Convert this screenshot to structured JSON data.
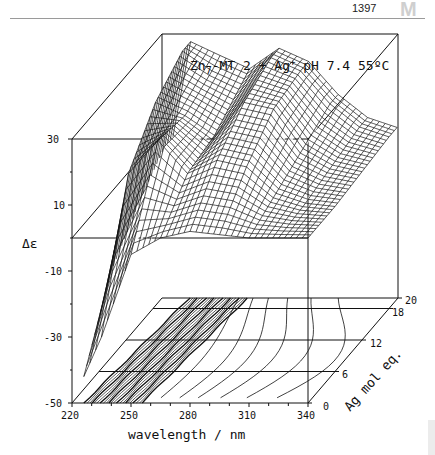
{
  "page": {
    "number": "1397",
    "section_mark": "M"
  },
  "chart_data": {
    "type": "surface3d",
    "title": "Zn7-MT 2 + Ag+  pH 7.4 55ºC",
    "title_parts": {
      "species": "Zn",
      "subscript": "7",
      "rest1": "-MT 2 + Ag",
      "superscript": "+",
      "rest2": "  pH 7.4 55ºC"
    },
    "xlabel": "wavelength / nm",
    "ylabel": "Δε",
    "zlabel": "Ag mol eq.",
    "x_ticks": [
      "220",
      "250",
      "280",
      "310",
      "340"
    ],
    "y_ticks": [
      "30",
      "10",
      "-10",
      "-30",
      "-50"
    ],
    "z_ticks": [
      "0",
      "6",
      "12",
      "18",
      "20"
    ],
    "xlim": [
      220,
      340
    ],
    "ylim": [
      -50,
      30
    ],
    "zlim": [
      0,
      20
    ],
    "grid": false,
    "legend": "none",
    "projection": "3D wireframe surface with contour map on floor plane",
    "surface_description": "CD titration of Zn7-MT 2 with Ag+: strong positive band near 230-240 nm saturating at ~30 at low Ag equivalents, broad positive ridge near 265-295 nm growing with Ag mol eq., values approaching 0 above ~310 nm",
    "series": [
      {
        "name": "0 mol eq. Ag+",
        "x": [
          220,
          235,
          250,
          265,
          280,
          295,
          310,
          325,
          340
        ],
        "values": [
          -50,
          -30,
          -5,
          0,
          2,
          1,
          0,
          0,
          0
        ]
      },
      {
        "name": "6 mol eq. Ag+",
        "x": [
          220,
          235,
          250,
          265,
          280,
          295,
          310,
          325,
          340
        ],
        "values": [
          -40,
          10,
          20,
          10,
          14,
          12,
          4,
          1,
          0
        ]
      },
      {
        "name": "12 mol eq. Ag+",
        "x": [
          220,
          235,
          250,
          265,
          280,
          295,
          310,
          325,
          340
        ],
        "values": [
          -30,
          22,
          18,
          12,
          22,
          20,
          8,
          3,
          1
        ]
      },
      {
        "name": "18 mol eq. Ag+",
        "x": [
          220,
          235,
          250,
          265,
          280,
          295,
          310,
          325,
          340
        ],
        "values": [
          -20,
          28,
          22,
          18,
          26,
          22,
          12,
          5,
          2
        ]
      },
      {
        "name": "20 mol eq. Ag+",
        "x": [
          220,
          235,
          250,
          265,
          280,
          295,
          310,
          325,
          340
        ],
        "values": [
          -20,
          28,
          24,
          20,
          26,
          22,
          12,
          5,
          2
        ]
      }
    ]
  }
}
